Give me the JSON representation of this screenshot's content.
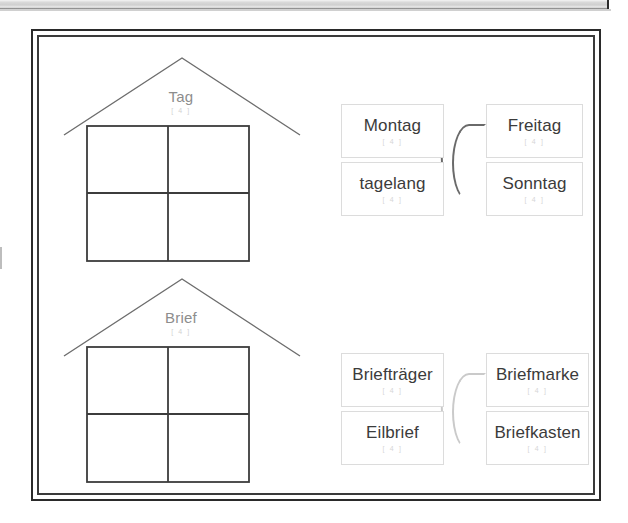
{
  "document": {
    "title": "Wortfamilien Arbeitsblatt",
    "background_color": "#ffffff",
    "frame_color": "#2a2a2a",
    "label_color": "#8d8d8d",
    "card_text_color": "#3b3b3b",
    "card_border_color": "#dcdcdc",
    "arc_color": "#6a6a6a",
    "arc_color_pale": "#cacaca",
    "subscript_color": "#d6d6d6"
  },
  "top_strip": {
    "icon": "scan-edge-strip"
  },
  "houses": [
    {
      "id": "house-tag",
      "label": "Tag",
      "sublabel": "[ 4 ]",
      "icon": "house-outline-icon",
      "cells": 4
    },
    {
      "id": "house-brief",
      "label": "Brief",
      "sublabel": "[ 4 ]",
      "icon": "house-outline-icon",
      "cells": 4
    }
  ],
  "clusters": [
    {
      "id": "cluster-tag",
      "arc_style": "dark",
      "groups": [
        {
          "id": "group-tag-left",
          "arc": "right-half-circle",
          "cards": [
            {
              "title": "Montag",
              "sublabel": "[ 4 ]"
            },
            {
              "title": "tagelang",
              "sublabel": "[ 4 ]"
            }
          ]
        },
        {
          "id": "group-tag-right",
          "arc": "left-half-circle",
          "cards": [
            {
              "title": "Freitag",
              "sublabel": "[ 4 ]"
            },
            {
              "title": "Sonntag",
              "sublabel": "[ 4 ]"
            }
          ]
        }
      ]
    },
    {
      "id": "cluster-brief",
      "arc_style": "pale",
      "groups": [
        {
          "id": "group-brief-left",
          "arc": "right-half-circle",
          "cards": [
            {
              "title": "Briefträger",
              "sublabel": "[ 4 ]"
            },
            {
              "title": "Eilbrief",
              "sublabel": "[ 4 ]"
            }
          ]
        },
        {
          "id": "group-brief-right",
          "arc": "left-half-circle",
          "cards": [
            {
              "title": "Briefmarke",
              "sublabel": "[ 4 ]"
            },
            {
              "title": "Briefkasten",
              "sublabel": "[ 4 ]"
            }
          ]
        }
      ]
    }
  ]
}
